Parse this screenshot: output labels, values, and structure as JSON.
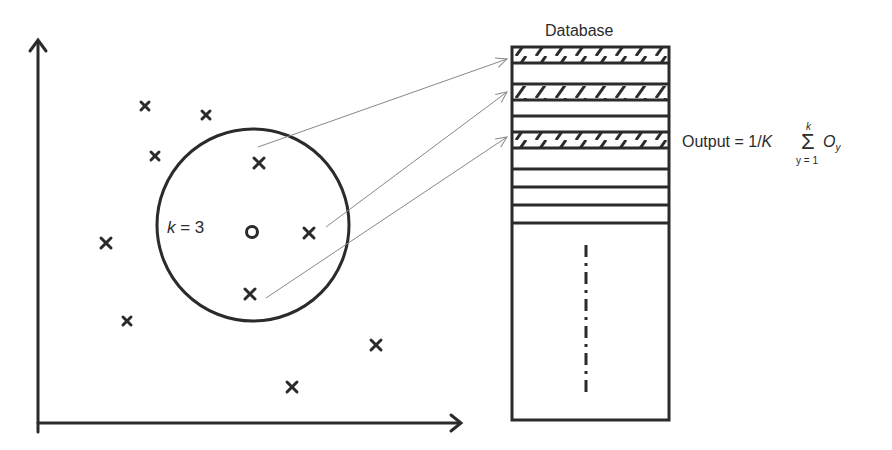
{
  "diagram": {
    "database": {
      "title": "Database",
      "rows": 11,
      "hatched_rows": [
        0,
        2,
        4
      ],
      "continuation": "vertical dash-dot line"
    },
    "query": {
      "label_var": "k",
      "label_eq": " = 3",
      "k": 3,
      "marker": "circle"
    },
    "formula": {
      "lhs": "Output = 1/",
      "K": "K",
      "sigma": "Σ",
      "upper": "k",
      "lower": "y = 1",
      "term": "O",
      "term_sub": "y"
    },
    "points_inside": [
      [
        259,
        163
      ],
      [
        309,
        233
      ],
      [
        250,
        294
      ]
    ],
    "points_outside": [
      [
        145,
        106
      ],
      [
        206,
        115
      ],
      [
        155,
        156
      ],
      [
        106,
        243
      ],
      [
        127,
        321
      ],
      [
        376,
        345
      ],
      [
        292,
        387
      ]
    ],
    "colors": {
      "ink": "#2b2b2b",
      "arrow": "#888888"
    }
  }
}
